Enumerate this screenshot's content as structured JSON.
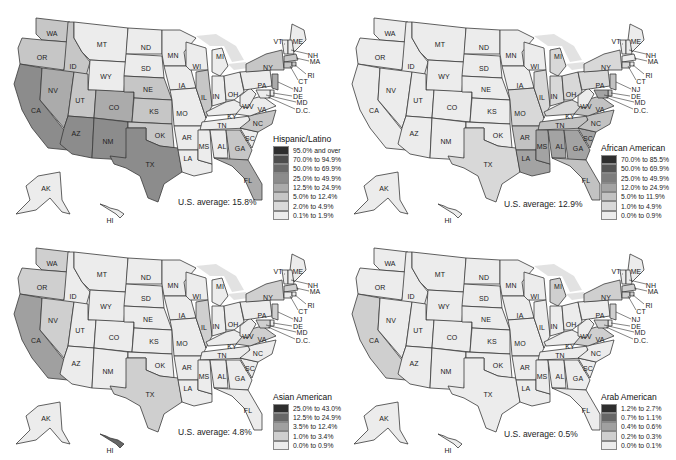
{
  "maps": [
    {
      "id": "hispanic",
      "legend": {
        "title": "Hispanic/Latino",
        "items": [
          {
            "label": "95.0% and over",
            "color": "#2e2e2e"
          },
          {
            "label": "70.0% to 94.9%",
            "color": "#4d4d4d"
          },
          {
            "label": "50.0% to 69.9%",
            "color": "#6a6a6a"
          },
          {
            "label": "25.0% to 49.9%",
            "color": "#8c8c8c"
          },
          {
            "label": "12.5% to 24.9%",
            "color": "#ababab"
          },
          {
            "label": "5.0% to 12.4%",
            "color": "#c6c6c6"
          },
          {
            "label": "2.0% to 4.9%",
            "color": "#dadada"
          },
          {
            "label": "0.1% to 1.9%",
            "color": "#ececec"
          }
        ]
      },
      "us_average": "U.S. average: 15.8%"
    },
    {
      "id": "african-american",
      "legend": {
        "title": "African American",
        "items": [
          {
            "label": "70.0% to 85.5%",
            "color": "#2e2e2e"
          },
          {
            "label": "50.0% to 69.9%",
            "color": "#555555"
          },
          {
            "label": "25.0% to 49.9%",
            "color": "#7d7d7d"
          },
          {
            "label": "12.0% to 24.9%",
            "color": "#a3a3a3"
          },
          {
            "label": "5.0% to 11.9%",
            "color": "#c2c2c2"
          },
          {
            "label": "1.0% to 4.9%",
            "color": "#d8d8d8"
          },
          {
            "label": "0.0% to 0.9%",
            "color": "#ececec"
          }
        ]
      },
      "us_average": "U.S. average: 12.9%"
    },
    {
      "id": "asian-american",
      "legend": {
        "title": "Asian American",
        "items": [
          {
            "label": "25.0% to 43.0%",
            "color": "#2e2e2e"
          },
          {
            "label": "12.5% to 24.9%",
            "color": "#666666"
          },
          {
            "label": "3.5% to 12.4%",
            "color": "#a0a0a0"
          },
          {
            "label": "1.0% to 3.4%",
            "color": "#cfcfcf"
          },
          {
            "label": "0.0% to 0.9%",
            "color": "#ececec"
          }
        ]
      },
      "us_average": "U.S. average: 4.8%"
    },
    {
      "id": "arab-american",
      "legend": {
        "title": "Arab American",
        "items": [
          {
            "label": "1.2% to 2.7%",
            "color": "#2e2e2e"
          },
          {
            "label": "0.7% to 1.1%",
            "color": "#666666"
          },
          {
            "label": "0.4% to 0.6%",
            "color": "#a0a0a0"
          },
          {
            "label": "0.2% to 0.3%",
            "color": "#cfcfcf"
          },
          {
            "label": "0.0% to 0.1%",
            "color": "#ececec"
          }
        ]
      },
      "us_average": "U.S. average: 0.5%"
    }
  ],
  "state_labels": {
    "WA": "WA",
    "OR": "OR",
    "CA": "CA",
    "ID": "ID",
    "NV": "NV",
    "MT": "MT",
    "WY": "WY",
    "UT": "UT",
    "AZ": "AZ",
    "CO": "CO",
    "NM": "NM",
    "ND": "ND",
    "SD": "SD",
    "NE": "NE",
    "KS": "KS",
    "OK": "OK",
    "TX": "TX",
    "MN": "MN",
    "IA": "IA",
    "MO": "MO",
    "AR": "AR",
    "LA": "LA",
    "WI": "WI",
    "IL": "IL",
    "MI": "MI",
    "IN": "IN",
    "OH": "OH",
    "KY": "KY",
    "TN": "TN",
    "MS": "MS",
    "AL": "AL",
    "GA": "GA",
    "FL": "FL",
    "SC": "SC",
    "NC": "NC",
    "VA": "VA",
    "WV": "WV",
    "PA": "PA",
    "NY": "NY",
    "VT": "VT",
    "ME": "ME",
    "NH": "NH",
    "MA": "MA",
    "RI": "RI",
    "CT": "CT",
    "NJ": "NJ",
    "DE": "DE",
    "MD": "MD",
    "DC": "D.C.",
    "AK": "AK",
    "HI": "HI"
  }
}
